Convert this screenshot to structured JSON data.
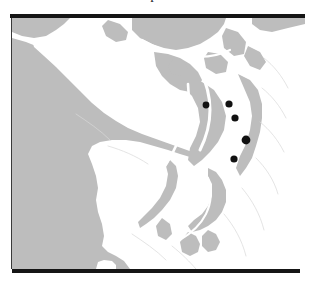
{
  "figure": {
    "kind": "printed-map-figure",
    "caption_remnant_glyph": "p",
    "rules": {
      "top_label": "top-rule",
      "bottom_label": "bottom-rule"
    }
  },
  "map": {
    "title": "",
    "region_name": "Puget Sound and Olympic Peninsula",
    "background_color": "#ffffff",
    "land_color": "#bdbdbd",
    "water_color": "#ffffff",
    "marker_color": "#111111",
    "marker_count": 5,
    "markers": [
      {
        "id": "site-1",
        "label": "",
        "x": 194,
        "y": 87,
        "r": 3.4
      },
      {
        "id": "site-2",
        "label": "",
        "x": 217,
        "y": 86,
        "r": 3.6
      },
      {
        "id": "site-3",
        "label": "",
        "x": 223,
        "y": 100,
        "r": 3.6
      },
      {
        "id": "site-4",
        "label": "",
        "x": 234,
        "y": 122,
        "r": 4.4
      },
      {
        "id": "site-5",
        "label": "",
        "x": 222,
        "y": 141,
        "r": 3.6
      }
    ]
  }
}
